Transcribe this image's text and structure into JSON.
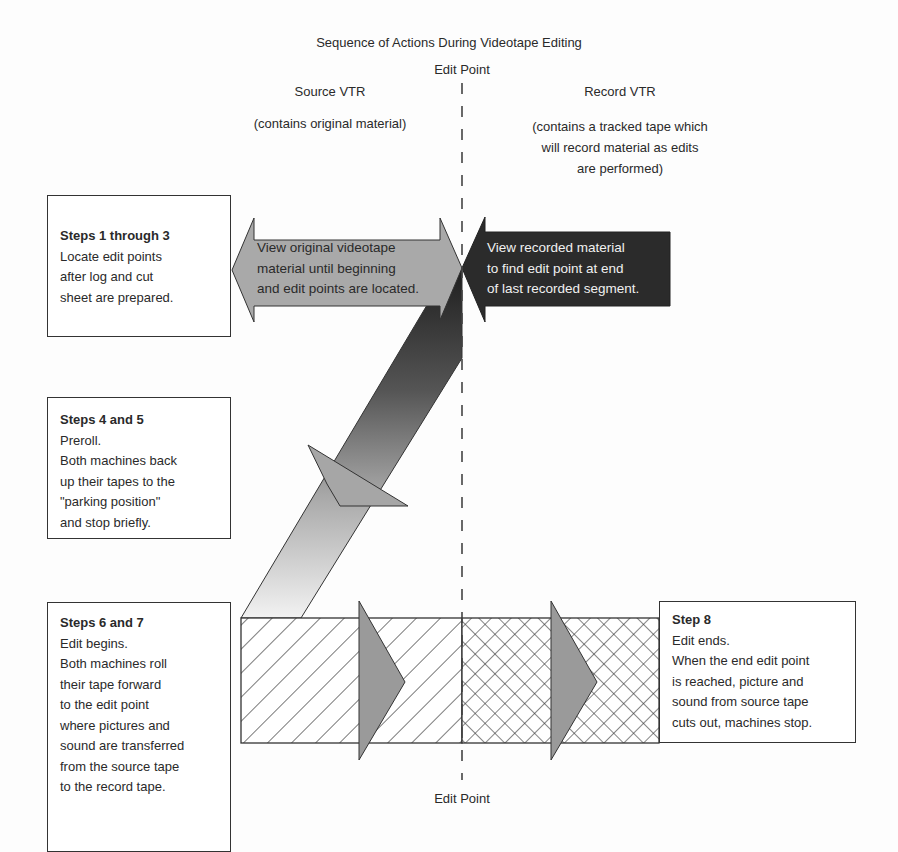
{
  "title": "Sequence of Actions During Videotape Editing",
  "edit_point_top": "Edit Point",
  "edit_point_bottom": "Edit Point",
  "source": {
    "heading": "Source VTR",
    "subtitle": "(contains original material)"
  },
  "record": {
    "heading": "Record VTR",
    "subtitle_lines": [
      "(contains a tracked tape which",
      "will record material as edits",
      "are performed)"
    ]
  },
  "arrows": {
    "source_view": {
      "lines": [
        "View original videotape",
        "material until beginning",
        "and edit points are located."
      ],
      "fill": "#a9a9a9"
    },
    "record_view": {
      "lines": [
        "View recorded material",
        "to find edit point at end",
        "of last recorded segment."
      ],
      "fill": "#2b2b2b"
    }
  },
  "steps": [
    {
      "title": "Steps 1 through 3",
      "lines": [
        "Locate edit points",
        "after log and cut",
        "sheet are prepared."
      ]
    },
    {
      "title": "Steps 4 and 5",
      "lines": [
        "Preroll.",
        "Both machines back",
        "up their tapes to the",
        "\"parking position\"",
        "and stop briefly."
      ]
    },
    {
      "title": "Steps 6 and 7",
      "lines": [
        "Edit begins.",
        "Both machines roll",
        "their tape forward",
        "to the edit point",
        "where pictures and",
        "sound are transferred",
        "from the source tape",
        "to the record tape."
      ]
    },
    {
      "title": "Step 8",
      "lines": [
        "Edit ends.",
        "When the end edit point",
        "is reached, picture and",
        "sound from source tape",
        "cuts out, machines stop."
      ]
    }
  ],
  "colors": {
    "line": "#333333",
    "arrowhead_gray": "#9a9a9a",
    "dark": "#2b2b2b"
  }
}
